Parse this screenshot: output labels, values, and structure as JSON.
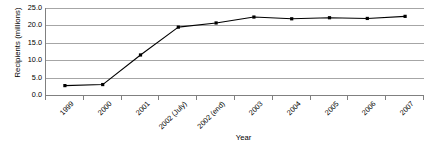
{
  "chart_data": {
    "type": "line",
    "title": "",
    "xlabel": "Year",
    "ylabel": "Recipients (millions)",
    "categories": [
      "1999",
      "2000",
      "2001",
      "2002 (July)",
      "2002 (end)",
      "2003",
      "2004",
      "2005",
      "2006",
      "2007"
    ],
    "values": [
      2.7,
      3.0,
      11.5,
      19.5,
      20.7,
      22.4,
      21.9,
      22.2,
      22.0,
      22.6
    ],
    "series": [
      {
        "name": "Recipients",
        "values": [
          2.7,
          3.0,
          11.5,
          19.5,
          20.7,
          22.4,
          21.9,
          22.2,
          22.0,
          22.6
        ]
      }
    ],
    "ylim": [
      0.0,
      25.0
    ],
    "ytick_values": [
      0.0,
      5.0,
      10.0,
      15.0,
      20.0,
      25.0
    ],
    "ytick_labels": [
      "0.0",
      "5.0",
      "10.0",
      "15.0",
      "20.0",
      "25.0"
    ],
    "grid": true,
    "grid_axis": "y",
    "legend": false,
    "legend_position": "none",
    "marker": "filled-square",
    "line_color": "#000000",
    "marker_color": "#000000",
    "grid_color": "#a6a6a6",
    "axis_color": "#808080",
    "background_color": "#ffffff",
    "xtick_label_rotation": -45
  }
}
